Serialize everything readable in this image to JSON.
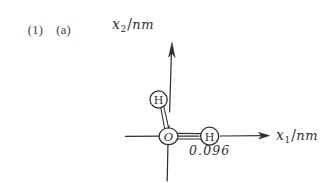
{
  "page": {
    "background_color": "#ffffff",
    "ink_color": "#2f2f2f",
    "width": 334,
    "height": 183
  },
  "header": {
    "problem_number": "(1)",
    "problem_part": "(a)"
  },
  "figure": {
    "caption_kind": "hand-drawn water molecule on cartesian axes",
    "axes": {
      "x_axis": {
        "label_symbol": "x",
        "label_subscript": "1",
        "label_slash": "/",
        "label_unit": "nm",
        "label_full": "x₁/nm",
        "direction": "horizontal-right",
        "has_arrowhead": true
      },
      "y_axis": {
        "label_symbol": "x",
        "label_subscript": "2",
        "label_slash": "/",
        "label_unit": "nm",
        "label_full": "x₂/nm",
        "direction": "vertical-up",
        "has_arrowhead": true
      },
      "origin_label": "O"
    },
    "atoms": [
      {
        "id": "atom-oxygen",
        "symbol": "O",
        "position": "origin"
      },
      {
        "id": "atom-hydrogen-upper",
        "symbol": "H",
        "position": "upper-left"
      },
      {
        "id": "atom-hydrogen-right",
        "symbol": "H",
        "position": "right-on-x-axis"
      }
    ],
    "bonds": [
      {
        "id": "bond-oxygen-hydrogen-upper",
        "from": "O",
        "to": "H",
        "style": "double-line"
      },
      {
        "id": "bond-oxygen-hydrogen-right",
        "from": "O",
        "to": "H",
        "style": "double-line",
        "length_label": "0.096"
      }
    ],
    "annotations": {
      "bond_length": "0.096"
    }
  }
}
